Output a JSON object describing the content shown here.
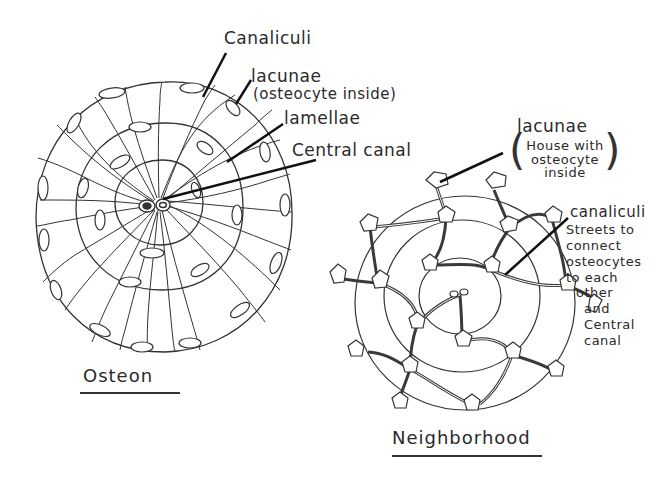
{
  "diagram": {
    "left": {
      "title": "Osteon",
      "labels": {
        "canaliculi": "Canaliculi",
        "lacunae": "lacunae",
        "lacunae_note": "(osteocyte inside)",
        "lamellae": "lamellae",
        "central_canal": "Central canal"
      }
    },
    "right": {
      "title": "Neighborhood",
      "labels": {
        "lacunae": "lacunae",
        "lacunae_note_1": "House with",
        "lacunae_note_2": "osteocyte",
        "lacunae_note_3": "inside",
        "canaliculi": "canaliculi",
        "canaliculi_note_1": "Streets to",
        "canaliculi_note_2": "connect",
        "canaliculi_note_3": "osteocytes",
        "canaliculi_note_4": "to each",
        "canaliculi_note_5": "other",
        "canaliculi_note_6": "and",
        "canaliculi_note_7": "Central",
        "canaliculi_note_8": "canal"
      }
    },
    "colors": {
      "ink": "#2a2a2a",
      "background": "#ffffff"
    }
  }
}
